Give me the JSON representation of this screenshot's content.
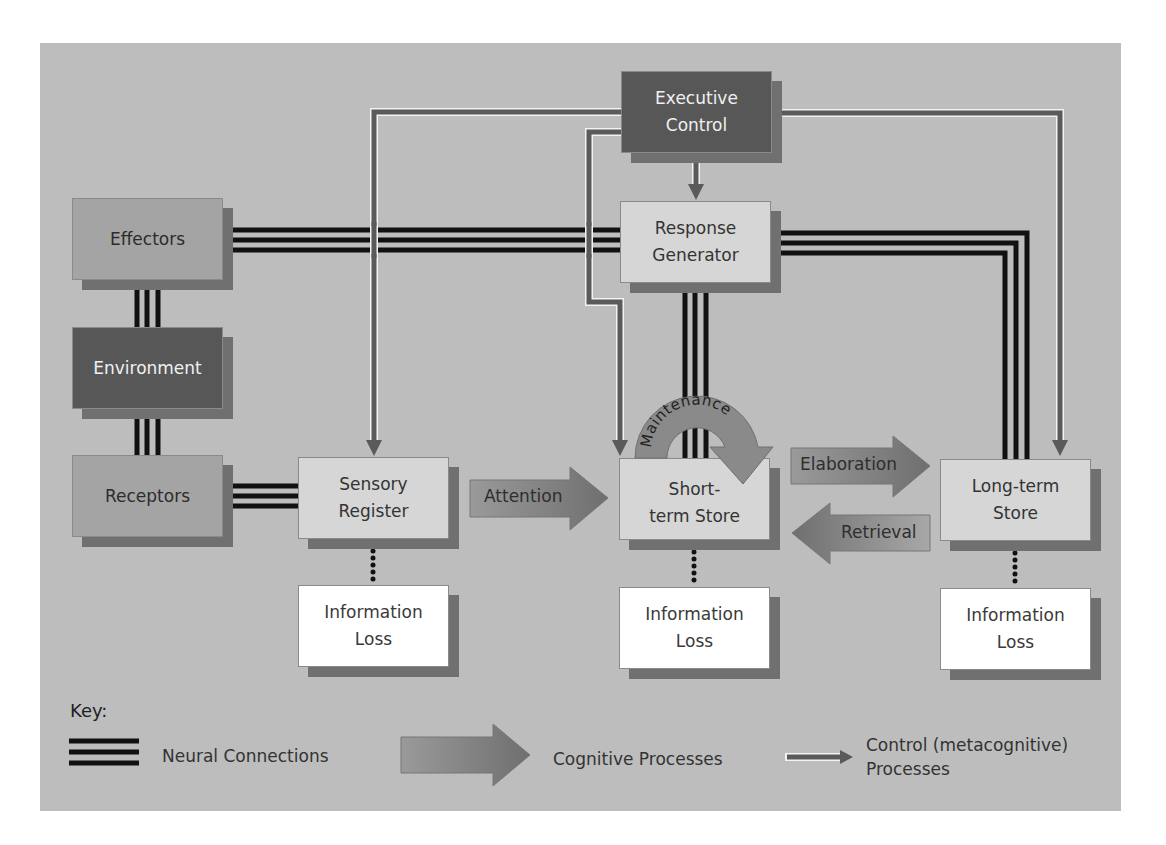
{
  "diagram": {
    "nodes": {
      "executive_control": "Executive\nControl",
      "response_generator": "Response\nGenerator",
      "effectors": "Effectors",
      "environment": "Environment",
      "receptors": "Receptors",
      "sensory_register": "Sensory\nRegister",
      "short_term_store": "Short-\nterm Store",
      "long_term_store": "Long-term\nStore",
      "info_loss_sensory": "Information\nLoss",
      "info_loss_short": "Information\nLoss",
      "info_loss_long": "Information\nLoss"
    },
    "processes": {
      "attention": "Attention",
      "maintenance": "Maintenance",
      "elaboration": "Elaboration",
      "retrieval": "Retrieval"
    },
    "colors": {
      "background": "#bdbdbd",
      "dark_box": "#575757",
      "mid_box": "#a4a4a4",
      "light_box": "#d6d6d6",
      "control_line": "#5a5a5a",
      "neural_line": "#111111",
      "process_arrow": "#8c8c8c"
    }
  },
  "key": {
    "title": "Key:",
    "neural": "Neural Connections",
    "cognitive": "Cognitive Processes",
    "control": "Control (metacognitive)\nProcesses"
  }
}
